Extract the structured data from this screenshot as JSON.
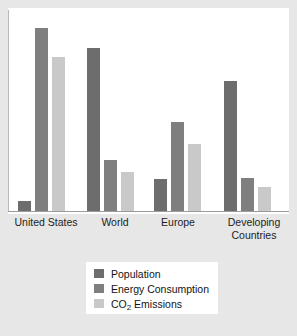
{
  "chart_data": {
    "type": "bar",
    "title": "",
    "xlabel": "",
    "ylabel": "",
    "grid": false,
    "legend_position": "bottom-center",
    "ylim": [
      0,
      100
    ],
    "categories": [
      "United States",
      "World",
      "Europe",
      "Developing\nCountries"
    ],
    "series": [
      {
        "name": "Population",
        "color": "#6d6d6d",
        "values": [
          5,
          83,
          16,
          66
        ]
      },
      {
        "name": "Energy Consumption",
        "color": "#7f7f7f",
        "values": [
          93,
          26,
          45,
          17
        ]
      },
      {
        "name": "CO2 Emissions",
        "color": "#c9c9c9",
        "values": [
          78,
          20,
          34,
          12
        ]
      }
    ]
  },
  "legend": {
    "items": [
      {
        "label": "Population",
        "label_pre": "Population",
        "label_sub": "",
        "label_post": ""
      },
      {
        "label": "Energy Consumption",
        "label_pre": "Energy Consumption",
        "label_sub": "",
        "label_post": ""
      },
      {
        "label": "CO2 Emissions",
        "label_pre": "CO",
        "label_sub": "2",
        "label_post": " Emissions"
      }
    ]
  },
  "axis": {
    "tick_labels": [
      "United States",
      "World",
      "Europe",
      "Developing\nCountries"
    ]
  },
  "colors": {
    "background": "#e7e7e7",
    "plot_background": "#ffffff",
    "axis_line": "#9c9c9c",
    "population": "#6d6d6d",
    "energy": "#7f7f7f",
    "co2": "#c9c9c9"
  }
}
